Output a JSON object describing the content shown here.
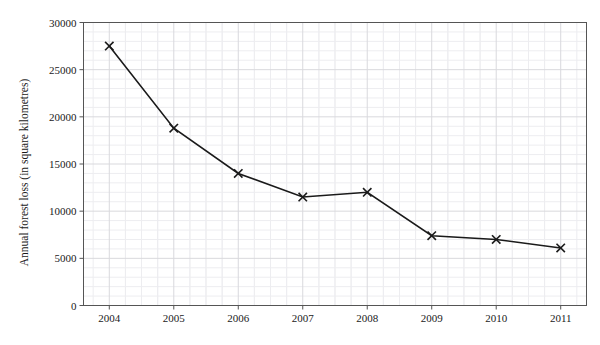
{
  "chart_data": {
    "type": "line",
    "title": "",
    "xlabel": "Year",
    "ylabel": "Annual forest loss (in square kilometres)",
    "categories": [
      "2004",
      "2005",
      "2006",
      "2007",
      "2008",
      "2009",
      "2010",
      "2011"
    ],
    "x": [
      2004,
      2005,
      2006,
      2007,
      2008,
      2009,
      2010,
      2011
    ],
    "values": [
      27500,
      18800,
      14000,
      11500,
      12000,
      7400,
      7000,
      6100
    ],
    "series": [
      {
        "name": "Annual forest loss",
        "values": [
          27500,
          18800,
          14000,
          11500,
          12000,
          7400,
          7000,
          6100
        ]
      }
    ],
    "ylim": [
      0,
      30000
    ],
    "xlim": [
      2003.6,
      2011.4
    ],
    "ytick_labels": [
      "0",
      "5000",
      "10000",
      "15000",
      "20000",
      "25000",
      "30000"
    ],
    "ytick_values": [
      0,
      5000,
      10000,
      15000,
      20000,
      25000,
      30000
    ],
    "xtick_labels": [
      "2004",
      "2005",
      "2006",
      "2007",
      "2008",
      "2009",
      "2010",
      "2011"
    ],
    "grid": true,
    "minor_grid": true,
    "legend": "none",
    "marker": "x",
    "line_color": "#1a1a1a",
    "marker_color": "#1a1a1a",
    "grid_color": "#d9d9dd",
    "minor_grid_color": "#ededf0",
    "axis_color": "#555555",
    "background": "#ffffff"
  }
}
